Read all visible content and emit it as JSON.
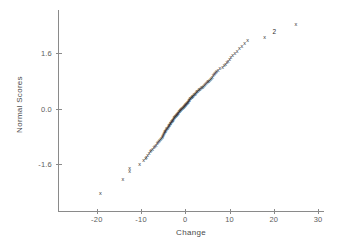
{
  "chart_data": {
    "type": "scatter",
    "title": "",
    "subtitle": "",
    "xlabel": "Change",
    "ylabel": "Normal Scores",
    "xlim": [
      -25,
      31
    ],
    "ylim": [
      -2.9,
      2.45
    ],
    "xticks": [
      -20,
      -10,
      0,
      10,
      20,
      30
    ],
    "xtick_labels": [
      "-20",
      "-10",
      "0",
      "10",
      "20",
      "30"
    ],
    "yticks": [
      1.6,
      0.0,
      -1.6
    ],
    "ytick_labels": [
      "1.6",
      "0.0",
      "-1.6"
    ],
    "grid": false,
    "legend": null,
    "marker": "x",
    "marker_color": "#2b2b2b",
    "axis_color": "#8a8a8a",
    "text_color": "#4a4a4a",
    "background": "#ffffff",
    "points": [
      {
        "x": -19.2,
        "y": -2.45,
        "label": "x"
      },
      {
        "x": -14.1,
        "y": -2.05,
        "label": "x"
      },
      {
        "x": -12.6,
        "y": -1.83,
        "label": "x"
      },
      {
        "x": -12.6,
        "y": -1.74,
        "label": "x"
      },
      {
        "x": -10.3,
        "y": -1.62,
        "label": "x"
      },
      {
        "x": -9.4,
        "y": -1.52,
        "label": "x"
      },
      {
        "x": -9.0,
        "y": -1.46,
        "label": "x"
      },
      {
        "x": -8.8,
        "y": -1.41,
        "label": "x"
      },
      {
        "x": -8.5,
        "y": -1.36,
        "label": "x"
      },
      {
        "x": -8.2,
        "y": -1.31,
        "label": "x"
      },
      {
        "x": -7.9,
        "y": -1.26,
        "label": "x"
      },
      {
        "x": -7.7,
        "y": -1.22,
        "label": "x"
      },
      {
        "x": -7.4,
        "y": -1.18,
        "label": "x"
      },
      {
        "x": -7.1,
        "y": -1.14,
        "label": "x"
      },
      {
        "x": -6.9,
        "y": -1.1,
        "label": "x"
      },
      {
        "x": -6.6,
        "y": -1.06,
        "label": "x"
      },
      {
        "x": -6.4,
        "y": -1.03,
        "label": "x"
      },
      {
        "x": -6.2,
        "y": -0.99,
        "label": "x"
      },
      {
        "x": -6.0,
        "y": -0.96,
        "label": "x"
      },
      {
        "x": -5.8,
        "y": -0.93,
        "label": "x"
      },
      {
        "x": -5.6,
        "y": -0.9,
        "label": "x"
      },
      {
        "x": -5.4,
        "y": -0.87,
        "label": "x"
      },
      {
        "x": -5.2,
        "y": -0.84,
        "label": "x"
      },
      {
        "x": -5.1,
        "y": -0.81,
        "label": "x"
      },
      {
        "x": -5.0,
        "y": -0.78,
        "label": "x"
      },
      {
        "x": -4.9,
        "y": -0.76,
        "label": "x"
      },
      {
        "x": -4.8,
        "y": -0.73,
        "label": "x"
      },
      {
        "x": -4.7,
        "y": -0.71,
        "label": "x"
      },
      {
        "x": -4.6,
        "y": -0.68,
        "label": "x"
      },
      {
        "x": -4.5,
        "y": -0.66,
        "label": "x"
      },
      {
        "x": -4.4,
        "y": -0.64,
        "label": "x"
      },
      {
        "x": -4.3,
        "y": -0.61,
        "label": "x"
      },
      {
        "x": -4.2,
        "y": -0.59,
        "label": "x"
      },
      {
        "x": -4.0,
        "y": -0.57,
        "label": "x"
      },
      {
        "x": -3.9,
        "y": -0.55,
        "label": "x"
      },
      {
        "x": -3.8,
        "y": -0.53,
        "label": "x"
      },
      {
        "x": -3.7,
        "y": -0.51,
        "label": "x"
      },
      {
        "x": -3.6,
        "y": -0.49,
        "label": "x"
      },
      {
        "x": -3.5,
        "y": -0.47,
        "label": "x"
      },
      {
        "x": -3.4,
        "y": -0.45,
        "label": "x"
      },
      {
        "x": -3.3,
        "y": -0.43,
        "label": "x"
      },
      {
        "x": -3.2,
        "y": -0.41,
        "label": "x"
      },
      {
        "x": -3.1,
        "y": -0.39,
        "label": "x"
      },
      {
        "x": -3.0,
        "y": -0.37,
        "label": "x"
      },
      {
        "x": -2.9,
        "y": -0.35,
        "label": "x"
      },
      {
        "x": -2.8,
        "y": -0.34,
        "label": "x"
      },
      {
        "x": -2.7,
        "y": -0.32,
        "label": "x"
      },
      {
        "x": -2.6,
        "y": -0.3,
        "label": "x"
      },
      {
        "x": -2.5,
        "y": -0.28,
        "label": "x"
      },
      {
        "x": -2.4,
        "y": -0.27,
        "label": "x"
      },
      {
        "x": -2.3,
        "y": -0.25,
        "label": "x"
      },
      {
        "x": -2.2,
        "y": -0.23,
        "label": "x"
      },
      {
        "x": -2.1,
        "y": -0.22,
        "label": "x"
      },
      {
        "x": -2.0,
        "y": -0.2,
        "label": "x"
      },
      {
        "x": -1.9,
        "y": -0.18,
        "label": "x"
      },
      {
        "x": -1.8,
        "y": -0.17,
        "label": "x"
      },
      {
        "x": -1.7,
        "y": -0.15,
        "label": "x"
      },
      {
        "x": -1.6,
        "y": -0.14,
        "label": "x"
      },
      {
        "x": -1.5,
        "y": -0.12,
        "label": "x"
      },
      {
        "x": -1.4,
        "y": -0.1,
        "label": "x"
      },
      {
        "x": -1.3,
        "y": -0.09,
        "label": "x"
      },
      {
        "x": -1.2,
        "y": -0.07,
        "label": "x"
      },
      {
        "x": -1.1,
        "y": -0.06,
        "label": "x"
      },
      {
        "x": -1.0,
        "y": -0.04,
        "label": "x"
      },
      {
        "x": -0.9,
        "y": -0.03,
        "label": "x"
      },
      {
        "x": -0.8,
        "y": -0.01,
        "label": "x"
      },
      {
        "x": -0.6,
        "y": 0.0,
        "label": "x"
      },
      {
        "x": -0.5,
        "y": 0.02,
        "label": "x"
      },
      {
        "x": -0.4,
        "y": 0.03,
        "label": "x"
      },
      {
        "x": -0.3,
        "y": 0.05,
        "label": "x"
      },
      {
        "x": -0.2,
        "y": 0.06,
        "label": "x"
      },
      {
        "x": -0.1,
        "y": 0.08,
        "label": "x"
      },
      {
        "x": 0.0,
        "y": 0.09,
        "label": "x"
      },
      {
        "x": 0.1,
        "y": 0.11,
        "label": "x"
      },
      {
        "x": 0.2,
        "y": 0.12,
        "label": "x"
      },
      {
        "x": 0.3,
        "y": 0.14,
        "label": "x"
      },
      {
        "x": 0.4,
        "y": 0.15,
        "label": "x"
      },
      {
        "x": 0.5,
        "y": 0.17,
        "label": "x"
      },
      {
        "x": 0.6,
        "y": 0.18,
        "label": "x"
      },
      {
        "x": 0.7,
        "y": 0.2,
        "label": "x"
      },
      {
        "x": 0.8,
        "y": 0.22,
        "label": "x"
      },
      {
        "x": 0.9,
        "y": 0.23,
        "label": "x"
      },
      {
        "x": 1.0,
        "y": 0.25,
        "label": "x"
      },
      {
        "x": 1.1,
        "y": 0.27,
        "label": "x"
      },
      {
        "x": 1.2,
        "y": 0.28,
        "label": "x"
      },
      {
        "x": 1.4,
        "y": 0.3,
        "label": "x"
      },
      {
        "x": 1.5,
        "y": 0.32,
        "label": "x"
      },
      {
        "x": 1.6,
        "y": 0.33,
        "label": "x"
      },
      {
        "x": 1.7,
        "y": 0.35,
        "label": "x"
      },
      {
        "x": 1.9,
        "y": 0.37,
        "label": "x"
      },
      {
        "x": 2.0,
        "y": 0.39,
        "label": "x"
      },
      {
        "x": 2.2,
        "y": 0.41,
        "label": "x"
      },
      {
        "x": 2.3,
        "y": 0.43,
        "label": "x"
      },
      {
        "x": 2.5,
        "y": 0.45,
        "label": "x"
      },
      {
        "x": 2.6,
        "y": 0.47,
        "label": "x"
      },
      {
        "x": 2.8,
        "y": 0.49,
        "label": "x"
      },
      {
        "x": 3.0,
        "y": 0.51,
        "label": "x"
      },
      {
        "x": 3.1,
        "y": 0.53,
        "label": "x"
      },
      {
        "x": 3.3,
        "y": 0.55,
        "label": "x"
      },
      {
        "x": 3.5,
        "y": 0.57,
        "label": "x"
      },
      {
        "x": 3.7,
        "y": 0.59,
        "label": "x"
      },
      {
        "x": 3.9,
        "y": 0.61,
        "label": "x"
      },
      {
        "x": 4.1,
        "y": 0.64,
        "label": "x"
      },
      {
        "x": 4.3,
        "y": 0.66,
        "label": "x"
      },
      {
        "x": 4.5,
        "y": 0.68,
        "label": "x"
      },
      {
        "x": 4.7,
        "y": 0.71,
        "label": "x"
      },
      {
        "x": 4.9,
        "y": 0.73,
        "label": "x"
      },
      {
        "x": 5.1,
        "y": 0.76,
        "label": "x"
      },
      {
        "x": 5.3,
        "y": 0.78,
        "label": "x"
      },
      {
        "x": 5.5,
        "y": 0.81,
        "label": "x"
      },
      {
        "x": 5.7,
        "y": 0.84,
        "label": "x"
      },
      {
        "x": 5.9,
        "y": 0.87,
        "label": "x"
      },
      {
        "x": 6.1,
        "y": 0.9,
        "label": "x"
      },
      {
        "x": 6.3,
        "y": 0.93,
        "label": "x"
      },
      {
        "x": 6.5,
        "y": 0.96,
        "label": "x"
      },
      {
        "x": 6.7,
        "y": 0.99,
        "label": "x"
      },
      {
        "x": 6.9,
        "y": 1.03,
        "label": "x"
      },
      {
        "x": 7.1,
        "y": 1.06,
        "label": "x"
      },
      {
        "x": 7.4,
        "y": 1.1,
        "label": "x"
      },
      {
        "x": 7.8,
        "y": 1.14,
        "label": "x"
      },
      {
        "x": 8.4,
        "y": 1.18,
        "label": "x"
      },
      {
        "x": 8.8,
        "y": 1.22,
        "label": "x"
      },
      {
        "x": 9.1,
        "y": 1.26,
        "label": "x"
      },
      {
        "x": 9.4,
        "y": 1.31,
        "label": "x"
      },
      {
        "x": 9.7,
        "y": 1.36,
        "label": "x"
      },
      {
        "x": 10.0,
        "y": 1.41,
        "label": "x"
      },
      {
        "x": 10.3,
        "y": 1.46,
        "label": "x"
      },
      {
        "x": 10.7,
        "y": 1.52,
        "label": "x"
      },
      {
        "x": 11.2,
        "y": 1.58,
        "label": "x"
      },
      {
        "x": 11.7,
        "y": 1.65,
        "label": "x"
      },
      {
        "x": 12.2,
        "y": 1.72,
        "label": "x"
      },
      {
        "x": 12.8,
        "y": 1.79,
        "label": "x"
      },
      {
        "x": 13.4,
        "y": 1.87,
        "label": "x"
      },
      {
        "x": 14.1,
        "y": 1.96,
        "label": "x"
      },
      {
        "x": 17.9,
        "y": 2.05,
        "label": "x"
      },
      {
        "x": 20.1,
        "y": 2.2,
        "label": "2"
      },
      {
        "x": 25.0,
        "y": 2.4,
        "label": "x"
      }
    ]
  }
}
